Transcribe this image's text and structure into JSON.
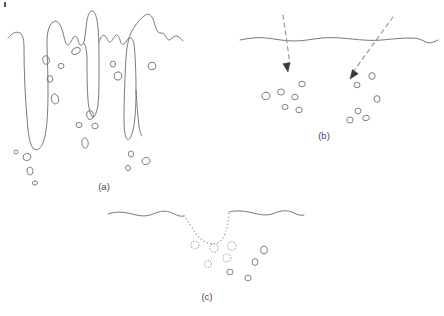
{
  "figure": {
    "type": "diagram",
    "background_color": "#ffffff",
    "stroke_color": "#6b6b6b",
    "arrow_color": "#3a3a3a",
    "dotted_color": "#9a9a9a",
    "label_color": "#4a4a4a",
    "width": 444,
    "height": 316,
    "panels": [
      {
        "id": "a",
        "label": "(a)",
        "label_x": 104,
        "label_y": 190,
        "description": "Irregular finger-like intrusion fronts descending from a rough surface with scattered elliptical bubbles below",
        "feature_name": "finger-intrusion-front",
        "surface_style": "solid-irregular",
        "bubble_style": "open-ellipse"
      },
      {
        "id": "b",
        "label": "(b)",
        "label_x": 324,
        "label_y": 139,
        "description": "Nearly flat wavy surface with two dashed inclined arrows penetrating it and bubble clusters beneath each arrow tip",
        "feature_name": "dashed-penetration-arrows",
        "surface_style": "solid-wavy",
        "bubble_style": "open-ellipse",
        "arrow_count": 2
      },
      {
        "id": "c",
        "label": "(c)",
        "label_x": 207,
        "label_y": 300,
        "description": "Wavy surface interrupted by a dotted crater depression with dotted bubbles near the crater and solid bubbles further below",
        "feature_name": "dotted-crater-depression",
        "surface_style": "solid-wavy-with-dotted-crater",
        "bubble_style": "mixed-dotted-and-solid"
      }
    ],
    "panel_a": {
      "surface_path": "M 8 38 C 12 33 16 31 20 33 C 23 35 24 40 24 48 C 24 70 25 95 27 118 C 28 134 30 145 33 148 C 37 152 41 149 44 140 C 47 130 48 112 48 92 C 48 70 47 52 47 42 C 47 32 49 25 53 22 C 57 19 61 24 63 33 C 65 41 66 45 68 45 C 70 45 71 41 73 38 C 75 35 77 36 78 40 C 79 44 80 46 82 45 C 84 44 85 38 86 28 C 87 17 89 11 92 11 C 95 11 97 17 98 28 C 99 39 99 52 99 68 C 99 84 99 96 98 104 C 97 112 95 117 93 117 C 91 117 89 111 88 100 C 87 88 87 74 87 62 C 87 52 86 45 84 43",
      "surface_path2": "M 99 42 C 101 36 103 34 105 36 C 107 38 108 42 110 42 C 112 42 113 38 115 36 C 117 34 119 36 120 40 C 121 44 122 45 124 44 C 126 43 127 39 129 38 C 131 37 133 39 134 44 C 135 52 136 70 136 90 C 136 108 135 122 133 130 C 131 138 129 141 127 139 C 125 137 124 130 124 118 C 124 100 125 75 126 58 C 127 44 129 36 132 31 C 136 24 140 19 144 16 C 148 13 151 14 153 19 C 155 24 156 30 158 32 C 160 34 162 32 164 34 C 166 36 167 40 169 40 C 171 40 173 36 176 36 C 179 36 181 39 183 41",
      "surface_path3": "M 136 90 C 137 105 138 118 139 126 C 140 132 141 135 142 136",
      "bubbles": [
        {
          "cx": 46,
          "cy": 60,
          "rx": 3.2,
          "ry": 4.2,
          "rot": -12
        },
        {
          "cx": 61,
          "cy": 66,
          "rx": 3.0,
          "ry": 2.6,
          "rot": 0
        },
        {
          "cx": 50,
          "cy": 79,
          "rx": 2.8,
          "ry": 3.4,
          "rot": -10
        },
        {
          "cx": 76,
          "cy": 51,
          "rx": 4.6,
          "ry": 3.0,
          "rot": -25
        },
        {
          "cx": 55,
          "cy": 99,
          "rx": 3.6,
          "ry": 5.0,
          "rot": -14
        },
        {
          "cx": 90,
          "cy": 115,
          "rx": 3.4,
          "ry": 4.4,
          "rot": -8
        },
        {
          "cx": 79,
          "cy": 125,
          "rx": 2.9,
          "ry": 2.6,
          "rot": 0
        },
        {
          "cx": 95,
          "cy": 126,
          "rx": 3.2,
          "ry": 2.8,
          "rot": 0
        },
        {
          "cx": 85,
          "cy": 143,
          "rx": 3.2,
          "ry": 5.2,
          "rot": -5
        },
        {
          "cx": 16,
          "cy": 152,
          "rx": 2.0,
          "ry": 2.0,
          "rot": 0
        },
        {
          "cx": 27,
          "cy": 157,
          "rx": 3.8,
          "ry": 3.4,
          "rot": -10
        },
        {
          "cx": 30,
          "cy": 171,
          "rx": 3.0,
          "ry": 3.8,
          "rot": -12
        },
        {
          "cx": 35,
          "cy": 183,
          "rx": 2.6,
          "ry": 2.0,
          "rot": -20
        },
        {
          "cx": 113,
          "cy": 64,
          "rx": 2.6,
          "ry": 3.0,
          "rot": 0
        },
        {
          "cx": 118,
          "cy": 76,
          "rx": 3.8,
          "ry": 4.0,
          "rot": -10
        },
        {
          "cx": 152,
          "cy": 66,
          "rx": 3.8,
          "ry": 3.6,
          "rot": -15
        },
        {
          "cx": 131,
          "cy": 154,
          "rx": 2.6,
          "ry": 3.0,
          "rot": 0
        },
        {
          "cx": 146,
          "cy": 161,
          "rx": 4.0,
          "ry": 3.4,
          "rot": -12
        },
        {
          "cx": 128,
          "cy": 168,
          "rx": 2.4,
          "ry": 2.6,
          "rot": -20
        }
      ]
    },
    "panel_b": {
      "surface_path": "M 240 40 C 250 38 258 37 266 38 C 276 39 284 41 294 41 C 304 41 312 39 322 38 C 332 37 342 38 352 39 C 362 40 372 41 382 40 C 392 39 402 38 412 38 C 418 38 422 40 426 42 C 430 44 434 42 438 40",
      "arrows": [
        {
          "dash_path": "M 283 15 L 290 64",
          "tip_x": 288,
          "tip_y": 72,
          "angle": 80
        },
        {
          "dash_path": "M 393 17 L 353 72",
          "tip_x": 350,
          "tip_y": 79,
          "angle": 126
        }
      ],
      "bubbles": [
        {
          "cx": 302,
          "cy": 84,
          "rx": 3.2,
          "ry": 2.8,
          "rot": 0
        },
        {
          "cx": 281,
          "cy": 92,
          "rx": 3.4,
          "ry": 3.0,
          "rot": 0
        },
        {
          "cx": 266,
          "cy": 96,
          "rx": 4.0,
          "ry": 3.6,
          "rot": -15
        },
        {
          "cx": 295,
          "cy": 97,
          "rx": 3.2,
          "ry": 2.8,
          "rot": 0
        },
        {
          "cx": 285,
          "cy": 107,
          "rx": 3.0,
          "ry": 2.6,
          "rot": 0
        },
        {
          "cx": 299,
          "cy": 110,
          "rx": 3.2,
          "ry": 2.8,
          "rot": 0
        },
        {
          "cx": 372,
          "cy": 76,
          "rx": 3.2,
          "ry": 3.4,
          "rot": 0
        },
        {
          "cx": 357,
          "cy": 85,
          "rx": 3.0,
          "ry": 2.8,
          "rot": 0
        },
        {
          "cx": 377,
          "cy": 99,
          "rx": 3.0,
          "ry": 3.4,
          "rot": 0
        },
        {
          "cx": 358,
          "cy": 111,
          "rx": 3.0,
          "ry": 2.8,
          "rot": 0
        },
        {
          "cx": 350,
          "cy": 120,
          "rx": 3.2,
          "ry": 3.0,
          "rot": 0
        },
        {
          "cx": 366,
          "cy": 118,
          "rx": 3.4,
          "ry": 2.6,
          "rot": -10
        }
      ]
    },
    "panel_c": {
      "surface_left_path": "M 108 214 C 116 211 124 212 132 214 C 140 216 146 217 153 214 C 160 211 166 210 172 213 C 177 215 180 217 184 216",
      "surface_right_path": "M 229 212 C 237 210 245 211 253 213 C 261 215 268 216 275 213 C 282 210 288 210 294 213 C 298 215 301 216 304 215",
      "crater_dotted_path": "M 184 216 C 189 222 193 230 198 236 C 204 243 212 246 219 242 C 225 238 228 228 229 212",
      "dotted_bubbles": [
        {
          "cx": 195,
          "cy": 245,
          "r": 4.0
        },
        {
          "cx": 214,
          "cy": 248,
          "r": 4.2
        },
        {
          "cx": 232,
          "cy": 246,
          "r": 4.2
        },
        {
          "cx": 227,
          "cy": 258,
          "r": 4.0
        },
        {
          "cx": 208,
          "cy": 264,
          "r": 3.6
        }
      ],
      "solid_bubbles": [
        {
          "cx": 264,
          "cy": 250,
          "rx": 3.4,
          "ry": 3.8,
          "rot": 0
        },
        {
          "cx": 255,
          "cy": 262,
          "rx": 3.0,
          "ry": 3.4,
          "rot": 0
        },
        {
          "cx": 230,
          "cy": 272,
          "rx": 3.2,
          "ry": 2.8,
          "rot": 0
        },
        {
          "cx": 248,
          "cy": 278,
          "rx": 3.2,
          "ry": 2.8,
          "rot": 0
        }
      ]
    }
  }
}
